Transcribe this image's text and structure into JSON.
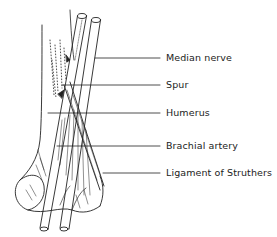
{
  "figure": {
    "type": "anatomical-illustration",
    "labels": [
      {
        "text": "Median nerve",
        "y": 58,
        "line_start_x": 95
      },
      {
        "text": "Spur",
        "y": 85,
        "line_start_x": 62
      },
      {
        "text": "Humerus",
        "y": 113,
        "line_start_x": 48
      },
      {
        "text": "Brachial artery",
        "y": 146,
        "line_start_x": 57
      },
      {
        "text": "Ligament of Struthers",
        "y": 173,
        "line_start_x": 103
      }
    ]
  },
  "colors": {
    "ink": "#222222",
    "background": "#ffffff"
  }
}
